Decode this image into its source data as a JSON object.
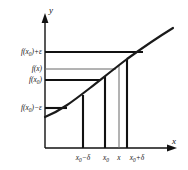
{
  "figure": {
    "name": "epsilon-delta-continuity-diagram",
    "axes": {
      "x_axis_label": "x",
      "y_axis_label": "y",
      "x_axis_color": "#111111",
      "y_axis_color": "#111111"
    },
    "y_labels": [
      {
        "id": "f-x0-plus-eps",
        "parts": {
          "f": "f",
          "open": "(",
          "x": "x",
          "sub": "0",
          "close": ")",
          "op": "+",
          "tail": "ε"
        },
        "text": "f(x₀) + ε",
        "y_px": 52
      },
      {
        "id": "f-x",
        "parts": {
          "f": "f",
          "open": "(",
          "x": "x",
          "sub": "",
          "close": ")",
          "op": "",
          "tail": ""
        },
        "text": "f(x)",
        "y_px": 69
      },
      {
        "id": "f-x0",
        "parts": {
          "f": "f",
          "open": "(",
          "x": "x",
          "sub": "0",
          "close": ")",
          "op": "",
          "tail": ""
        },
        "text": "f(x₀)",
        "y_px": 80
      },
      {
        "id": "f-x0-minus-eps",
        "parts": {
          "f": "f",
          "open": "(",
          "x": "x",
          "sub": "0",
          "close": ")",
          "op": "−",
          "tail": "ε"
        },
        "text": "f(x₀) − ε",
        "y_px": 108
      }
    ],
    "x_labels": [
      {
        "id": "x0-minus-delta",
        "parts": {
          "x": "x",
          "sub": "0",
          "op": "−",
          "tail": "δ"
        },
        "text": "x₀ − δ",
        "x_px": 83
      },
      {
        "id": "x0",
        "parts": {
          "x": "x",
          "sub": "0",
          "op": "",
          "tail": ""
        },
        "text": "x₀",
        "x_px": 105
      },
      {
        "id": "x-point",
        "parts": {
          "x": "x",
          "sub": "",
          "op": "",
          "tail": ""
        },
        "text": "x",
        "x_px": 119
      },
      {
        "id": "x0-plus-delta",
        "parts": {
          "x": "x",
          "sub": "0",
          "op": "+",
          "tail": "δ"
        },
        "text": "x₀ + δ",
        "x_px": 127
      }
    ],
    "curve": {
      "name": "function-curve",
      "description": "increasing concave curve through the band",
      "color": "#1a1a1a",
      "stroke_width": 2.1,
      "points": [
        [
          45,
          117
        ],
        [
          60,
          110
        ],
        [
          75,
          100
        ],
        [
          90,
          88
        ],
        [
          105,
          76
        ],
        [
          119,
          65
        ],
        [
          127,
          59
        ],
        [
          140,
          49
        ],
        [
          152,
          41
        ],
        [
          165,
          34
        ],
        [
          172,
          30
        ]
      ]
    },
    "horizontal_lines": [
      {
        "name": "line-f-x0-plus-eps",
        "y_px": 52,
        "x_start": 45,
        "x_end": 143,
        "stroke_width": 2.1,
        "color": "#111111"
      },
      {
        "name": "line-f-x",
        "y_px": 69,
        "x_start": 45,
        "x_end": 116,
        "stroke_width": 1.0,
        "color": "#555555"
      },
      {
        "name": "line-f-x0",
        "y_px": 80,
        "x_start": 45,
        "x_end": 101,
        "stroke_width": 2.1,
        "color": "#111111"
      },
      {
        "name": "line-f-x0-minus-eps",
        "y_px": 108,
        "x_start": 45,
        "x_end": 66,
        "stroke_width": 2.1,
        "color": "#111111"
      }
    ],
    "vertical_lines": [
      {
        "name": "drop-x0-minus-delta",
        "x_px": 83,
        "y_top": 95,
        "y_bottom": 148,
        "stroke_width": 2.1,
        "color": "#111111"
      },
      {
        "name": "drop-x0",
        "x_px": 105,
        "y_top": 76,
        "y_bottom": 148,
        "stroke_width": 2.1,
        "color": "#111111"
      },
      {
        "name": "drop-x",
        "x_px": 119,
        "y_top": 65,
        "y_bottom": 148,
        "stroke_width": 1.0,
        "color": "#666666"
      },
      {
        "name": "drop-x0-plus-delta",
        "x_px": 127,
        "y_top": 59,
        "y_bottom": 148,
        "stroke_width": 2.1,
        "color": "#111111"
      }
    ],
    "axis_geometry": {
      "y_axis_x": 45,
      "y_axis_top": 18,
      "y_axis_bottom": 148,
      "x_axis_y": 148,
      "x_axis_left": 45,
      "x_axis_right": 176
    }
  }
}
